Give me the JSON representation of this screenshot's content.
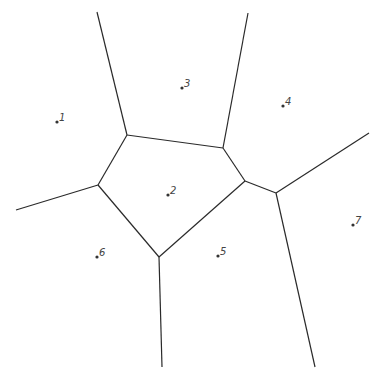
{
  "diagram": {
    "type": "voronoi",
    "background": "#ffffff",
    "edge_color": "#2a2a2a",
    "sites": [
      {
        "label": "1",
        "x": 57,
        "y": 122
      },
      {
        "label": "2",
        "x": 168,
        "y": 195
      },
      {
        "label": "3",
        "x": 182,
        "y": 88
      },
      {
        "label": "4",
        "x": 283,
        "y": 106
      },
      {
        "label": "5",
        "x": 218,
        "y": 256
      },
      {
        "label": "6",
        "x": 97,
        "y": 257
      },
      {
        "label": "7",
        "x": 353,
        "y": 225
      }
    ],
    "vertices": [
      {
        "id": "a",
        "x": 127,
        "y": 135
      },
      {
        "id": "b",
        "x": 223,
        "y": 148
      },
      {
        "id": "c",
        "x": 245,
        "y": 181
      },
      {
        "id": "d",
        "x": 276,
        "y": 193
      },
      {
        "id": "e",
        "x": 98,
        "y": 185
      },
      {
        "id": "f",
        "x": 159,
        "y": 257
      }
    ],
    "edges": [
      {
        "x1": 97,
        "y1": 12,
        "x2": 127,
        "y2": 135
      },
      {
        "x1": 248,
        "y1": 13,
        "x2": 223,
        "y2": 148
      },
      {
        "x1": 127,
        "y1": 135,
        "x2": 223,
        "y2": 148
      },
      {
        "x1": 223,
        "y1": 148,
        "x2": 245,
        "y2": 181
      },
      {
        "x1": 245,
        "y1": 181,
        "x2": 276,
        "y2": 193
      },
      {
        "x1": 276,
        "y1": 193,
        "x2": 369,
        "y2": 133
      },
      {
        "x1": 276,
        "y1": 193,
        "x2": 315,
        "y2": 367
      },
      {
        "x1": 245,
        "y1": 181,
        "x2": 159,
        "y2": 257
      },
      {
        "x1": 159,
        "y1": 257,
        "x2": 162,
        "y2": 367
      },
      {
        "x1": 159,
        "y1": 257,
        "x2": 98,
        "y2": 185
      },
      {
        "x1": 98,
        "y1": 185,
        "x2": 127,
        "y2": 135
      },
      {
        "x1": 98,
        "y1": 185,
        "x2": 16,
        "y2": 210
      }
    ]
  }
}
